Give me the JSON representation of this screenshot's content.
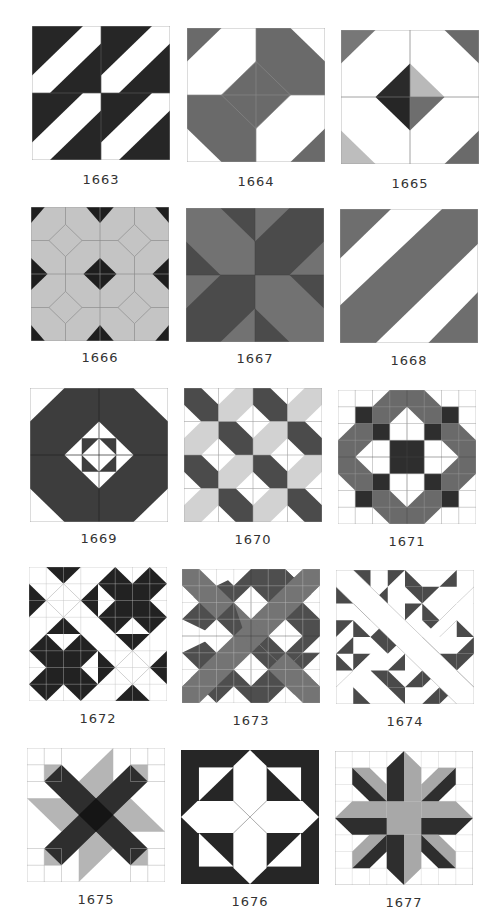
{
  "page": {
    "header_fragment": "",
    "colors": {
      "black": "#262626",
      "dark": "#3a3a3a",
      "medium": "#6e6e6e",
      "mid": "#5a5a5a",
      "light": "#b5b5b5",
      "pale": "#cfcfcf",
      "white": "#ffffff",
      "line": "#9a9a9a"
    },
    "blocks": [
      {
        "id": "1663",
        "label": "1663"
      },
      {
        "id": "1664",
        "label": "1664"
      },
      {
        "id": "1665",
        "label": "1665"
      },
      {
        "id": "1666",
        "label": "1666"
      },
      {
        "id": "1667",
        "label": "1667"
      },
      {
        "id": "1668",
        "label": "1668"
      },
      {
        "id": "1669",
        "label": "1669"
      },
      {
        "id": "1670",
        "label": "1670"
      },
      {
        "id": "1671",
        "label": "1671"
      },
      {
        "id": "1672",
        "label": "1672"
      },
      {
        "id": "1673",
        "label": "1673"
      },
      {
        "id": "1674",
        "label": "1674"
      },
      {
        "id": "1675",
        "label": "1675"
      },
      {
        "id": "1676",
        "label": "1676"
      },
      {
        "id": "1677",
        "label": "1677"
      }
    ]
  }
}
